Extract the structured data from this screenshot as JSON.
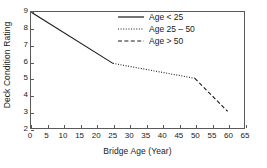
{
  "chart_data": {
    "type": "line",
    "title": "",
    "xlabel": "Bridge Age (Year)",
    "ylabel": "Deck Condition Rating",
    "xlim": [
      0,
      65
    ],
    "ylim": [
      2,
      9
    ],
    "xticks": [
      0,
      5,
      10,
      15,
      20,
      25,
      30,
      35,
      40,
      45,
      50,
      55,
      60,
      65
    ],
    "xticklabels": [
      "0",
      "5",
      "10",
      "15",
      "20",
      "25",
      "30",
      "35",
      "40",
      "45",
      "50",
      "55",
      "60",
      "65"
    ],
    "yticks": [
      2,
      3,
      4,
      5,
      6,
      7,
      8,
      9
    ],
    "yticklabels": [
      "2",
      "3",
      "4",
      "5",
      "6",
      "7",
      "8",
      "9"
    ],
    "grid": false,
    "legend_position": "upper right",
    "line_color": "#1a1a1a",
    "frame_color": "#5a5a5a",
    "background": "#ffffff",
    "series": [
      {
        "name": "Age < 25",
        "style": "solid",
        "x": [
          0,
          25
        ],
        "y": [
          9.0,
          5.9
        ]
      },
      {
        "name": "Age 25 – 50",
        "style": "dotted",
        "x": [
          25,
          50
        ],
        "y": [
          5.9,
          5.0
        ]
      },
      {
        "name": "Age > 50",
        "style": "dashed",
        "x": [
          50,
          60
        ],
        "y": [
          5.0,
          3.0
        ]
      }
    ]
  },
  "legend": {
    "entries": [
      {
        "label": "Age < 25",
        "style": "solid"
      },
      {
        "label": "Age 25 – 50",
        "style": "dotted"
      },
      {
        "label": "Age > 50",
        "style": "dashed"
      }
    ]
  }
}
